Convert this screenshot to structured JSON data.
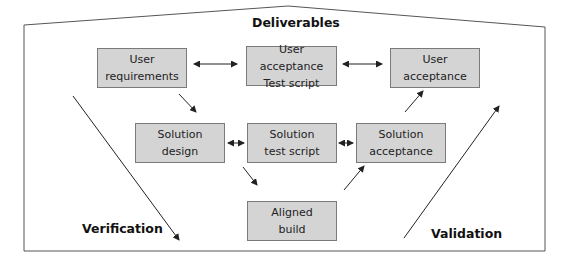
{
  "title": "Deliverables",
  "side_labels": {
    "left": "Verification",
    "right": "Validation"
  },
  "colors": {
    "box_fill": "#d4d4d4",
    "box_border": "#7a7a7a",
    "line": "#333333"
  },
  "boxes": [
    {
      "id": "user-requirements",
      "line1": "User",
      "line2": "requirements"
    },
    {
      "id": "user-acceptance-test-script",
      "line1": "User acceptance",
      "line2": "Test script"
    },
    {
      "id": "user-acceptance",
      "line1": "User",
      "line2": "acceptance"
    },
    {
      "id": "solution-design",
      "line1": "Solution",
      "line2": "design"
    },
    {
      "id": "solution-test-script",
      "line1": "Solution",
      "line2": "test script"
    },
    {
      "id": "solution-acceptance",
      "line1": "Solution",
      "line2": "acceptance"
    },
    {
      "id": "aligned-build",
      "line1": "Aligned",
      "line2": "build"
    }
  ],
  "connections": [
    {
      "from": "user-requirements",
      "to": "user-acceptance-test-script",
      "type": "bidirectional"
    },
    {
      "from": "user-acceptance-test-script",
      "to": "user-acceptance",
      "type": "bidirectional"
    },
    {
      "from": "solution-design",
      "to": "solution-test-script",
      "type": "bidirectional"
    },
    {
      "from": "solution-test-script",
      "to": "solution-acceptance",
      "type": "bidirectional"
    },
    {
      "from": "user-requirements",
      "to": "solution-design",
      "type": "directed"
    },
    {
      "from": "solution-test-script",
      "to": "aligned-build",
      "type": "directed"
    },
    {
      "from": "aligned-build",
      "to": "solution-acceptance",
      "type": "directed"
    },
    {
      "from": "solution-acceptance",
      "to": "user-acceptance",
      "type": "directed"
    }
  ]
}
